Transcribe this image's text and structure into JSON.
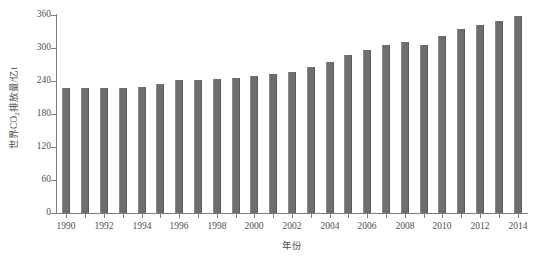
{
  "chart_data": {
    "type": "bar",
    "title": "",
    "subtitle": "",
    "xlabel": "年份",
    "ylabel": "世界CO2排放量/亿t",
    "ylabel_parts": {
      "pre": "世界CO",
      "sub": "2",
      "post": "排放量/亿t"
    },
    "grid": false,
    "legend": false,
    "legend_position": "none",
    "ylim": [
      0,
      360
    ],
    "yticks": [
      0,
      60,
      120,
      180,
      240,
      300,
      360
    ],
    "ytick_labels": [
      "0",
      "60",
      "120",
      "180",
      "240",
      "300",
      "360"
    ],
    "xtick_labels": [
      "1990",
      "1992",
      "1994",
      "1996",
      "1998",
      "2000",
      "2002",
      "2004",
      "2006",
      "2008",
      "2010",
      "2012",
      "2014"
    ],
    "bar_color": "#6e6e6e",
    "axis_color": "#7d7d7d",
    "text_color": "#4f4f4f",
    "categories": [
      "1990",
      "1991",
      "1992",
      "1993",
      "1994",
      "1995",
      "1996",
      "1997",
      "1998",
      "1999",
      "2000",
      "2001",
      "2002",
      "2003",
      "2004",
      "2005",
      "2006",
      "2007",
      "2008",
      "2009",
      "2010",
      "2011",
      "2012",
      "2013",
      "2014"
    ],
    "values": [
      228,
      228,
      227,
      228,
      230,
      235,
      241,
      242,
      243,
      245,
      250,
      252,
      256,
      266,
      275,
      287,
      297,
      306,
      311,
      306,
      322,
      335,
      341,
      350,
      358
    ],
    "annotations": []
  }
}
